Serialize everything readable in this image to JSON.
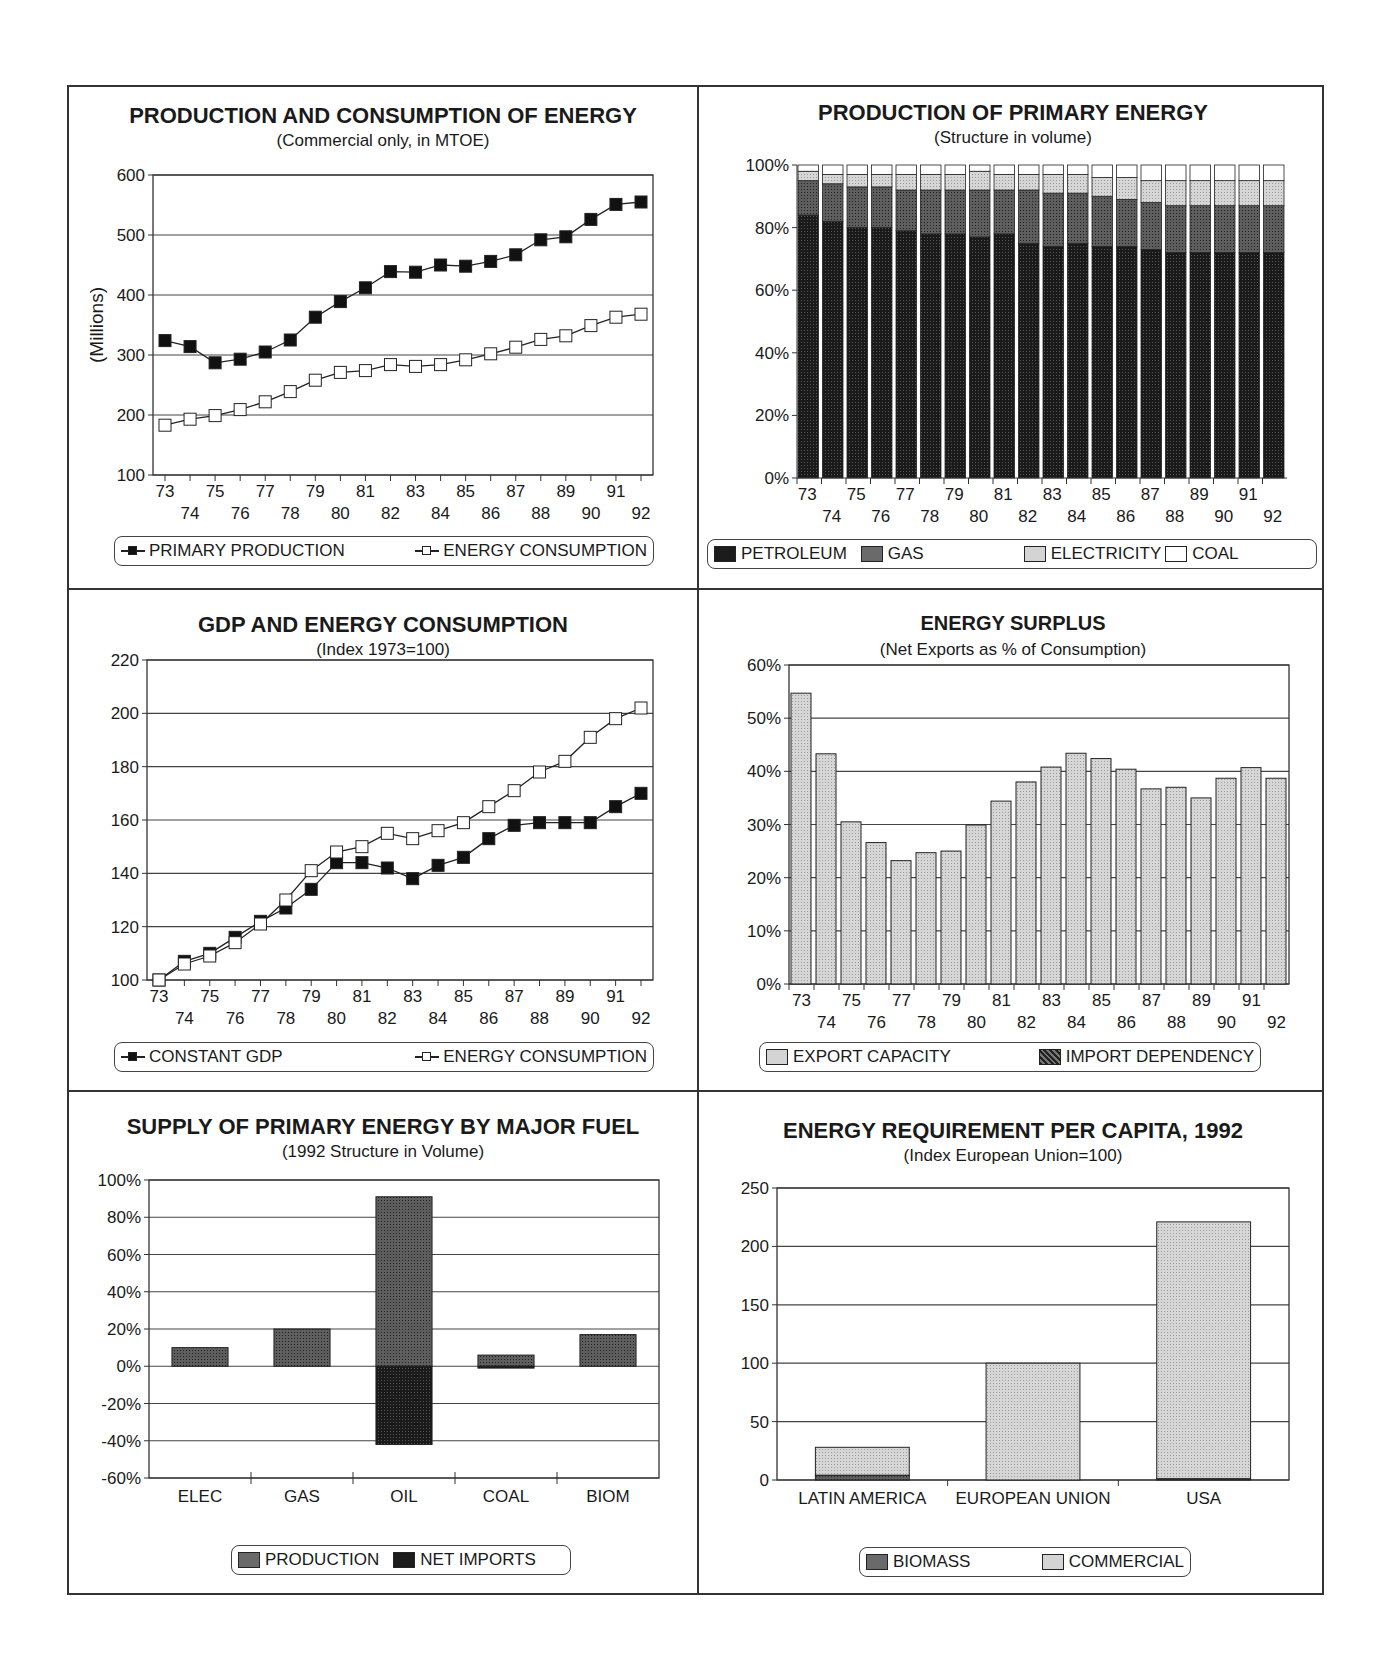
{
  "charts": {
    "c1": {
      "title": "PRODUCTION AND CONSUMPTION OF ENERGY",
      "subtitle": "(Commercial only, in MTOE)",
      "ylabel": "(Millions)",
      "legend": [
        "PRIMARY PRODUCTION",
        "ENERGY CONSUMPTION"
      ]
    },
    "c2": {
      "title": "PRODUCTION OF PRIMARY ENERGY",
      "subtitle": "(Structure in volume)",
      "legend": [
        "PETROLEUM",
        "GAS",
        "ELECTRICITY",
        "COAL"
      ]
    },
    "c3": {
      "title": "GDP AND ENERGY CONSUMPTION",
      "subtitle": "(Index 1973=100)",
      "legend": [
        "CONSTANT GDP",
        "ENERGY CONSUMPTION"
      ]
    },
    "c4": {
      "title": "ENERGY SURPLUS",
      "subtitle": "(Net Exports as % of Consumption)",
      "legend": [
        "EXPORT CAPACITY",
        "IMPORT DEPENDENCY"
      ]
    },
    "c5": {
      "title": "SUPPLY OF PRIMARY ENERGY BY MAJOR FUEL",
      "subtitle": "(1992 Structure in Volume)",
      "legend": [
        "PRODUCTION",
        "NET IMPORTS"
      ]
    },
    "c6": {
      "title": "ENERGY REQUIREMENT PER CAPITA, 1992",
      "subtitle": "(Index European Union=100)",
      "legend": [
        "BIOMASS",
        "COMMERCIAL"
      ]
    }
  },
  "chart_data": [
    {
      "type": "line",
      "title": "PRODUCTION AND CONSUMPTION OF ENERGY",
      "subtitle": "(Commercial only, in MTOE)",
      "xlabel": "",
      "ylabel": "(Millions)",
      "x": [
        "73",
        "74",
        "75",
        "76",
        "77",
        "78",
        "79",
        "80",
        "81",
        "82",
        "83",
        "84",
        "85",
        "86",
        "87",
        "88",
        "89",
        "90",
        "91",
        "92"
      ],
      "series": [
        {
          "name": "PRIMARY PRODUCTION",
          "marker": "filled-square",
          "values": [
            324,
            314,
            287,
            293,
            305,
            325,
            363,
            389,
            412,
            439,
            438,
            450,
            448,
            456,
            467,
            492,
            497,
            526,
            551,
            555
          ]
        },
        {
          "name": "ENERGY CONSUMPTION",
          "marker": "open-square",
          "values": [
            183,
            193,
            199,
            209,
            222,
            239,
            258,
            271,
            274,
            284,
            281,
            284,
            292,
            302,
            313,
            326,
            332,
            349,
            363,
            368
          ]
        }
      ],
      "ylim": [
        100,
        600
      ],
      "yticks": [
        100,
        200,
        300,
        400,
        500,
        600
      ],
      "grid": true,
      "legend_position": "bottom"
    },
    {
      "type": "bar",
      "stacked": true,
      "title": "PRODUCTION OF PRIMARY ENERGY",
      "subtitle": "(Structure in volume)",
      "x": [
        "73",
        "74",
        "75",
        "76",
        "77",
        "78",
        "79",
        "80",
        "81",
        "82",
        "83",
        "84",
        "85",
        "86",
        "87",
        "88",
        "89",
        "90",
        "91",
        "92"
      ],
      "series": [
        {
          "name": "PETROLEUM",
          "values": [
            84,
            82,
            80,
            80,
            79,
            78,
            78,
            77,
            78,
            75,
            74,
            75,
            74,
            74,
            73,
            72,
            72,
            72,
            72,
            72
          ]
        },
        {
          "name": "GAS",
          "values": [
            11,
            12,
            13,
            13,
            13,
            14,
            14,
            15,
            14,
            17,
            17,
            16,
            16,
            15,
            15,
            15,
            15,
            15,
            15,
            15
          ]
        },
        {
          "name": "ELECTRICITY",
          "values": [
            3,
            3,
            4,
            4,
            5,
            5,
            5,
            6,
            5,
            5,
            6,
            6,
            6,
            7,
            7,
            8,
            8,
            8,
            8,
            8
          ]
        },
        {
          "name": "COAL",
          "values": [
            2,
            3,
            3,
            3,
            3,
            3,
            3,
            2,
            3,
            3,
            3,
            3,
            4,
            4,
            5,
            5,
            5,
            5,
            5,
            5
          ]
        }
      ],
      "ylim": [
        0,
        100
      ],
      "yticks": [
        "0%",
        "20%",
        "40%",
        "60%",
        "80%",
        "100%"
      ],
      "grid": false,
      "legend_position": "bottom"
    },
    {
      "type": "line",
      "title": "GDP AND ENERGY CONSUMPTION",
      "subtitle": "(Index 1973=100)",
      "x": [
        "73",
        "74",
        "75",
        "76",
        "77",
        "78",
        "79",
        "80",
        "81",
        "82",
        "83",
        "84",
        "85",
        "86",
        "87",
        "88",
        "89",
        "90",
        "91",
        "92"
      ],
      "series": [
        {
          "name": "CONSTANT GDP",
          "marker": "filled-square",
          "values": [
            100,
            107,
            110,
            116,
            122,
            127,
            134,
            144,
            144,
            142,
            138,
            143,
            146,
            153,
            158,
            159,
            159,
            159,
            165,
            170
          ]
        },
        {
          "name": "ENERGY CONSUMPTION",
          "marker": "open-square",
          "values": [
            100,
            106,
            109,
            114,
            121,
            130,
            141,
            148,
            150,
            155,
            153,
            156,
            159,
            165,
            171,
            178,
            182,
            191,
            198,
            202
          ]
        }
      ],
      "ylim": [
        100,
        220
      ],
      "yticks": [
        100,
        120,
        140,
        160,
        180,
        200,
        220
      ],
      "grid": true,
      "legend_position": "bottom"
    },
    {
      "type": "bar",
      "title": "ENERGY SURPLUS",
      "subtitle": "(Net Exports as % of Consumption)",
      "x": [
        "73",
        "74",
        "75",
        "76",
        "77",
        "78",
        "79",
        "80",
        "81",
        "82",
        "83",
        "84",
        "85",
        "86",
        "87",
        "88",
        "89",
        "90",
        "91",
        "92"
      ],
      "series": [
        {
          "name": "EXPORT CAPACITY",
          "values": [
            54.7,
            43.3,
            30.5,
            26.6,
            23.2,
            24.7,
            25.0,
            29.9,
            34.4,
            38.0,
            40.8,
            43.4,
            42.4,
            40.4,
            36.7,
            37.0,
            35.0,
            38.7,
            40.7,
            38.7
          ]
        },
        {
          "name": "IMPORT DEPENDENCY",
          "values": [
            0,
            0,
            0,
            0,
            0,
            0,
            0,
            0,
            0,
            0,
            0,
            0,
            0,
            0,
            0,
            0,
            0,
            0,
            0,
            0
          ]
        }
      ],
      "ylim": [
        0,
        60
      ],
      "yticks": [
        "0%",
        "10%",
        "20%",
        "30%",
        "40%",
        "50%",
        "60%"
      ],
      "grid": true,
      "legend_position": "bottom"
    },
    {
      "type": "bar",
      "title": "SUPPLY OF PRIMARY ENERGY BY MAJOR FUEL",
      "subtitle": "(1992 Structure in Volume)",
      "categories": [
        "ELEC",
        "GAS",
        "OIL",
        "COAL",
        "BIOM"
      ],
      "series": [
        {
          "name": "PRODUCTION",
          "values": [
            10,
            20,
            91,
            6,
            17
          ]
        },
        {
          "name": "NET IMPORTS",
          "values": [
            0,
            0,
            -42,
            -1,
            0
          ]
        }
      ],
      "ylim": [
        -60,
        100
      ],
      "yticks": [
        "-60%",
        "-40%",
        "-20%",
        "0%",
        "20%",
        "40%",
        "60%",
        "80%",
        "100%"
      ],
      "grid": true,
      "legend_position": "bottom"
    },
    {
      "type": "bar",
      "stacked": true,
      "title": "ENERGY REQUIREMENT PER CAPITA, 1992",
      "subtitle": "(Index European Union=100)",
      "categories": [
        "LATIN AMERICA",
        "EUROPEAN UNION",
        "USA"
      ],
      "series": [
        {
          "name": "BIOMASS",
          "values": [
            4,
            0,
            1
          ]
        },
        {
          "name": "COMMERCIAL",
          "values": [
            24,
            100,
            220
          ]
        }
      ],
      "ylim": [
        0,
        250
      ],
      "yticks": [
        0,
        50,
        100,
        150,
        200,
        250
      ],
      "grid": true,
      "legend_position": "bottom"
    }
  ]
}
